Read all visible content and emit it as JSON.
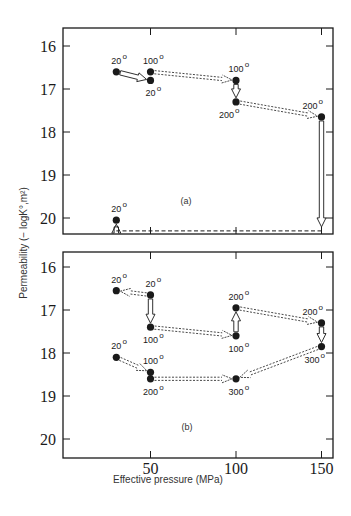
{
  "chart_data": [
    {
      "type": "scatter",
      "panel": "(a)",
      "xlabel": "Effective pressure (MPa)",
      "ylabel": "Permeability   (−logK°,m²)",
      "xlim": [
        0,
        155
      ],
      "ylim": [
        20.4,
        15.6
      ],
      "y_inverted": true,
      "xticks": [
        50,
        100,
        150
      ],
      "yticks": [
        16,
        17,
        18,
        19,
        20
      ],
      "grid": false,
      "points": [
        {
          "id": "a1",
          "x": 30,
          "y": 16.6,
          "label": "20",
          "label_pos": "above"
        },
        {
          "id": "a2",
          "x": 50,
          "y": 16.6,
          "label": "100",
          "label_pos": "above"
        },
        {
          "id": "a3",
          "x": 50,
          "y": 16.8,
          "label": "20",
          "label_pos": "below"
        },
        {
          "id": "a4",
          "x": 100,
          "y": 16.8,
          "label": "100",
          "label_pos": "above"
        },
        {
          "id": "a5",
          "x": 100,
          "y": 17.3,
          "label": "200",
          "label_pos": "below-left"
        },
        {
          "id": "a6",
          "x": 150,
          "y": 17.65,
          "label": "200",
          "label_pos": "above-left"
        },
        {
          "id": "a7",
          "x": 30,
          "y": 20.05,
          "label": "20",
          "label_pos": "above"
        }
      ],
      "arrows": [
        {
          "from": "a1",
          "to": "a3",
          "style": "solid"
        },
        {
          "from": "a2",
          "to": "a4",
          "style": "dashed-double"
        },
        {
          "from": "a4",
          "to": "a5",
          "style": "solid"
        },
        {
          "from": "a5",
          "to": "a6",
          "style": "dashed-double"
        },
        {
          "from": "a6",
          "to_xy": [
            150,
            20.3
          ],
          "style": "solid"
        },
        {
          "from_xy": [
            150,
            20.3
          ],
          "to_xy": [
            30,
            20.3
          ],
          "style": "dashed-line"
        },
        {
          "from_xy": [
            30,
            20.3
          ],
          "to": "a7",
          "style": "solid"
        }
      ]
    },
    {
      "type": "scatter",
      "panel": "(b)",
      "xlabel": "Effective pressure (MPa)",
      "ylabel": "Permeability   (−logK°,m²)",
      "xlim": [
        0,
        155
      ],
      "ylim": [
        20.4,
        15.6
      ],
      "y_inverted": true,
      "xticks": [
        50,
        100,
        150
      ],
      "yticks": [
        16,
        17,
        18,
        19,
        20
      ],
      "grid": false,
      "points": [
        {
          "id": "b1",
          "x": 30,
          "y": 16.55,
          "label": "20",
          "label_pos": "above"
        },
        {
          "id": "b2",
          "x": 50,
          "y": 16.65,
          "label": "20",
          "label_pos": "above"
        },
        {
          "id": "b3",
          "x": 50,
          "y": 17.4,
          "label": "100",
          "label_pos": "below"
        },
        {
          "id": "b4",
          "x": 100,
          "y": 17.6,
          "label": "100",
          "label_pos": "below"
        },
        {
          "id": "b5",
          "x": 100,
          "y": 16.95,
          "label": "200",
          "label_pos": "above"
        },
        {
          "id": "b6",
          "x": 150,
          "y": 17.3,
          "label": "200",
          "label_pos": "above-left"
        },
        {
          "id": "b7",
          "x": 150,
          "y": 17.85,
          "label": "300",
          "label_pos": "below-left"
        },
        {
          "id": "b8",
          "x": 30,
          "y": 18.1,
          "label": "20",
          "label_pos": "above"
        },
        {
          "id": "b9",
          "x": 50,
          "y": 18.45,
          "label": "100",
          "label_pos": "above"
        },
        {
          "id": "b10",
          "x": 50,
          "y": 18.6,
          "label": "200",
          "label_pos": "below"
        },
        {
          "id": "b11",
          "x": 100,
          "y": 18.6,
          "label": "300",
          "label_pos": "below"
        }
      ],
      "arrows": [
        {
          "from": "b2",
          "to": "b1",
          "style": "dashed-double"
        },
        {
          "from": "b2",
          "to": "b3",
          "style": "solid"
        },
        {
          "from": "b3",
          "to": "b4",
          "style": "dashed-double"
        },
        {
          "from": "b4",
          "to": "b5",
          "style": "solid"
        },
        {
          "from": "b5",
          "to": "b6",
          "style": "dashed-double"
        },
        {
          "from": "b6",
          "to": "b7",
          "style": "solid"
        },
        {
          "from": "b7",
          "to": "b11",
          "style": "dashed-double"
        },
        {
          "from": "b10",
          "to": "b11",
          "style": "dashed-double"
        },
        {
          "from": "b8",
          "to": "b9",
          "style": "dashed-double"
        }
      ]
    }
  ],
  "figure": {
    "x_axis_title": "Effective pressure (MPa)",
    "y_axis_title": "Permeability   (− logK°,m²)",
    "panel_a_label": "(a)",
    "panel_b_label": "(b)",
    "x_tick_labels": [
      "50",
      "100",
      "150"
    ],
    "y_tick_labels": [
      "16",
      "17",
      "18",
      "19",
      "20"
    ],
    "degree_symbol": "o"
  },
  "colors": {
    "ink": "#1a1a1a",
    "arrow_fill": "#ffffff",
    "background": "#ffffff"
  }
}
